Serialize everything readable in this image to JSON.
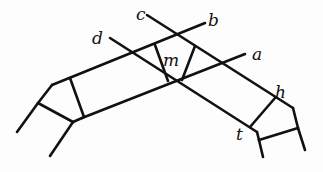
{
  "figure": {
    "labels": {
      "a": "a",
      "b": "b",
      "c": "c",
      "d": "d",
      "m": "m",
      "h": "h",
      "t": "t"
    },
    "stroke_color": "#111111",
    "background_color": "#fdfdfd"
  }
}
